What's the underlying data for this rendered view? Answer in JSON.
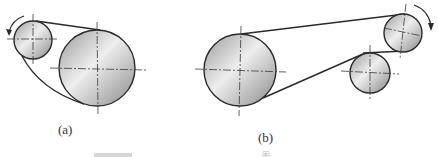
{
  "figure": {
    "panels": [
      {
        "id": "a",
        "label": "(a)",
        "pulleys": [
          {
            "name": "driver-small",
            "cx": 33,
            "cy": 40,
            "r": 19
          },
          {
            "name": "driven-large",
            "cx": 97,
            "cy": 68,
            "r": 38
          }
        ],
        "rotation": "counterclockwise"
      },
      {
        "id": "b",
        "label": "(b)",
        "pulleys": [
          {
            "name": "large",
            "cx": 240,
            "cy": 70,
            "r": 36
          },
          {
            "name": "driver-small-top",
            "cx": 403,
            "cy": 33,
            "r": 19
          },
          {
            "name": "idler-middle",
            "cx": 370,
            "cy": 73,
            "r": 20
          }
        ],
        "rotation": "clockwise"
      }
    ],
    "footer_mark": "图"
  },
  "colors": {
    "stroke": "#2a2a2a",
    "centerline": "#3a3a3a",
    "fill_light": "#f2f2f2",
    "fill_dark": "#8a8a8a"
  }
}
